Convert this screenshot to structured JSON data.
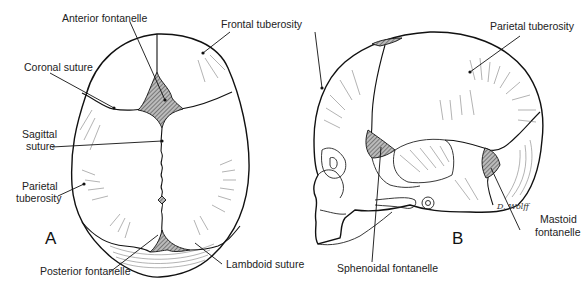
{
  "figure": {
    "panels": [
      {
        "id": "A",
        "letter": "A",
        "view": "superior",
        "labels": [
          {
            "key": "anterior_fontanelle",
            "text": "Anterior fontanelle"
          },
          {
            "key": "frontal_tuberosity",
            "text": "Frontal tuberosity"
          },
          {
            "key": "coronal_suture",
            "text": "Coronal suture"
          },
          {
            "key": "sagittal_suture_1",
            "text": "Sagittal"
          },
          {
            "key": "sagittal_suture_2",
            "text": "suture"
          },
          {
            "key": "parietal_tuberosity_1",
            "text": "Parietal"
          },
          {
            "key": "parietal_tuberosity_2",
            "text": "tuberosity"
          },
          {
            "key": "posterior_fontanelle",
            "text": "Posterior fontanelle"
          },
          {
            "key": "lambdoid_suture",
            "text": "Lambdoid suture"
          }
        ]
      },
      {
        "id": "B",
        "letter": "B",
        "view": "lateral",
        "labels": [
          {
            "key": "parietal_tuberosity",
            "text": "Parietal tuberosity"
          },
          {
            "key": "mastoid_fontanelle_1",
            "text": "Mastoid"
          },
          {
            "key": "mastoid_fontanelle_2",
            "text": "fontanelle"
          },
          {
            "key": "sphenoidal_fontanelle",
            "text": "Sphenoidal fontanelle"
          }
        ],
        "signature": "D. Wolff"
      }
    ]
  }
}
